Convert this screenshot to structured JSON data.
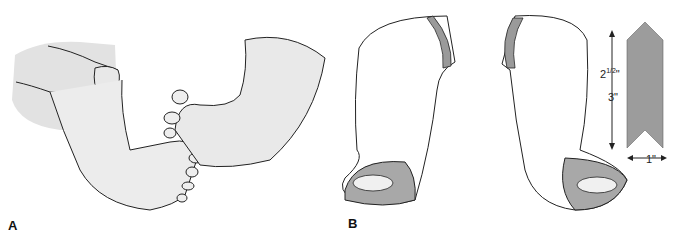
{
  "figure": {
    "panels": [
      {
        "label": "A",
        "description": "Hand holding infant foot, opposing foot with toes"
      },
      {
        "label": "B",
        "description": "Two leg casts with felt padding strips and a chevron-shaped felt strip"
      }
    ],
    "dimensions": {
      "length_1": "2",
      "length_1_frac": "1/2",
      "length_1_unit": "\"",
      "length_2": "3\"",
      "width": "1\""
    },
    "colors": {
      "skin_shade": "#e6e6e6",
      "line": "#222222",
      "felt": "#9a9a9a"
    }
  }
}
